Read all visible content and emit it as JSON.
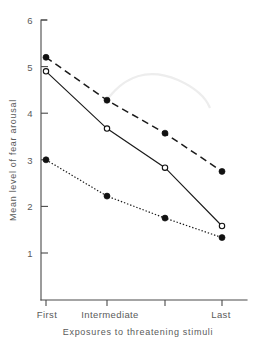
{
  "chart_data": {
    "type": "line",
    "title": "",
    "xlabel": "Exposures to threatening stimuli",
    "ylabel": "Mean level of fear arousal",
    "categories": [
      "First",
      "",
      "Intermediate",
      "Last"
    ],
    "x_tick_labels": [
      "First",
      "Intermediate",
      "Last"
    ],
    "y_tick_labels": [
      "1",
      "2",
      "3",
      "4",
      "5",
      "6"
    ],
    "y_ticks": [
      1,
      2,
      3,
      4,
      5,
      6
    ],
    "ylim": [
      0.45,
      6
    ],
    "xlim": [
      0,
      3
    ],
    "x_positions": [
      0,
      1,
      2,
      3
    ],
    "grid": false,
    "legend": "none",
    "series": [
      {
        "name": "dashed-filled-circle",
        "line_style": "dashed",
        "marker": "filled-circle",
        "values": [
          5.2,
          4.28,
          3.57,
          2.75
        ]
      },
      {
        "name": "solid-open-circle",
        "line_style": "solid",
        "marker": "open-circle",
        "values": [
          4.9,
          3.67,
          2.83,
          1.58
        ]
      },
      {
        "name": "dotted-filled-circle",
        "line_style": "dotted",
        "marker": "filled-circle",
        "values": [
          3.0,
          2.22,
          1.75,
          1.33
        ]
      }
    ]
  },
  "axes": {
    "y_label": "Mean level of fear arousal",
    "x_label": "Exposures to threatening stimuli",
    "y_tick_6": "6",
    "y_tick_5": "5",
    "y_tick_4": "4",
    "y_tick_3": "3",
    "y_tick_2": "2",
    "y_tick_1": "1",
    "x_tick_first": "First",
    "x_tick_intermediate": "Intermediate",
    "x_tick_last": "Last"
  },
  "colors": {
    "ink": "#1a1a1a",
    "axis": "#4a4a4a",
    "text": "#5a5a5a",
    "background": "#ffffff",
    "artifact": "#ededed"
  }
}
